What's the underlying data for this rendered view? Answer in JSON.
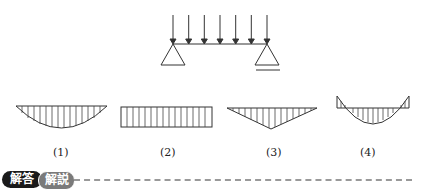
{
  "problem": {
    "load_arrow_count": 7,
    "support_left": "pin",
    "support_right": "roller"
  },
  "options": [
    {
      "label": "(1)",
      "shape": "parabola-downward"
    },
    {
      "label": "(2)",
      "shape": "rectangle"
    },
    {
      "label": "(3)",
      "shape": "triangle-downward"
    },
    {
      "label": "(4)",
      "shape": "parabola-with-negative-ends"
    }
  ],
  "footer": {
    "answer_badge": "解答",
    "explanation_badge": "解説"
  },
  "colors": {
    "line": "#333333",
    "answer_badge_bg": "#1a1a1a",
    "explanation_badge_bg": "#7a7a7a"
  }
}
